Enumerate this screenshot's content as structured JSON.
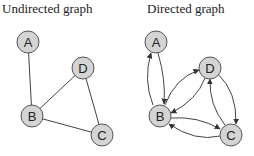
{
  "undirected": {
    "title": "Undirected graph",
    "nodes": [
      {
        "id": "A",
        "label": "A"
      },
      {
        "id": "B",
        "label": "B"
      },
      {
        "id": "C",
        "label": "C"
      },
      {
        "id": "D",
        "label": "D"
      }
    ],
    "edges": [
      [
        "A",
        "B"
      ],
      [
        "B",
        "D"
      ],
      [
        "B",
        "C"
      ],
      [
        "D",
        "C"
      ]
    ]
  },
  "directed": {
    "title": "Directed graph",
    "nodes": [
      {
        "id": "A",
        "label": "A"
      },
      {
        "id": "B",
        "label": "B"
      },
      {
        "id": "C",
        "label": "C"
      },
      {
        "id": "D",
        "label": "D"
      }
    ],
    "edges": [
      [
        "A",
        "B"
      ],
      [
        "B",
        "A"
      ],
      [
        "B",
        "D"
      ],
      [
        "D",
        "B"
      ],
      [
        "B",
        "C"
      ],
      [
        "C",
        "B"
      ],
      [
        "D",
        "C"
      ],
      [
        "C",
        "D"
      ]
    ]
  },
  "colors": {
    "node_fill": "#d4d4d4",
    "node_stroke": "#555555",
    "edge": "#444444"
  }
}
